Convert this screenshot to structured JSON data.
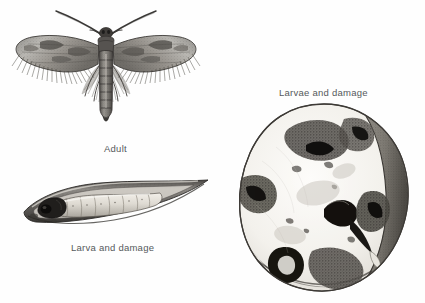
{
  "plate": {
    "title": "Insect pest life-stage and damage illustration plate",
    "background_color": "#fefefe",
    "ink_color": "#2b2b2b",
    "caption_color": "#55595c",
    "width": 425,
    "height": 303
  },
  "figures": [
    {
      "id": "adult",
      "caption": "Adult",
      "subject": "adult-moth",
      "description": "Pen-and-ink stipple drawing of an adult moth with wings spread, long antennae and fringed hind margins",
      "caption_position": "below-center"
    },
    {
      "id": "larva",
      "caption": "Larva and damage",
      "subject": "larva-in-grain",
      "description": "Pale segmented caterpillar with dark head capsule burrowing inside a hollowed grain kernel",
      "caption_position": "below-center"
    },
    {
      "id": "larvae",
      "caption": "Larvae and damage",
      "subject": "larvae-damaged-fruit",
      "description": "Cut fruit or seed showing dark frass-filled feeding tunnels and larvae within the flesh",
      "caption_position": "above-center"
    }
  ],
  "captions": {
    "adult": "Adult",
    "larva": "Larva and damage",
    "larvae": "Larvae and damage"
  }
}
